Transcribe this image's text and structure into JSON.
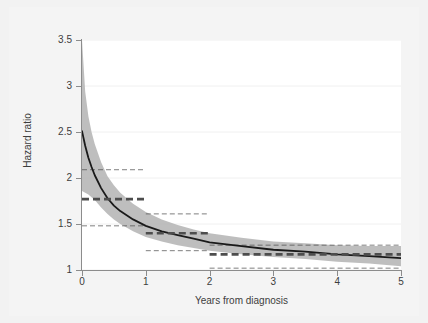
{
  "chart_data": {
    "type": "line",
    "title": "",
    "subtitle": "",
    "xlabel": "Years from diagnosis",
    "ylabel": "Hazard ratio",
    "xlim": [
      0,
      5
    ],
    "ylim": [
      1,
      3.5
    ],
    "xticks": [
      0,
      1,
      2,
      3,
      4,
      5
    ],
    "xtick_labels": [
      "0",
      "1",
      "2",
      "3",
      "4",
      "5"
    ],
    "yticks": [
      1,
      1.5,
      2,
      2.5,
      3,
      3.5
    ],
    "ytick_labels": [
      "1",
      "1.5",
      "2",
      "2.5",
      "3",
      "3.5"
    ],
    "grid": "horizontal-faint",
    "legend": "none",
    "series": [
      {
        "name": "Flexible parametric hazard ratio",
        "style": "solid-line",
        "color": "#1a1a1a",
        "x": [
          0.0,
          0.05,
          0.1,
          0.15,
          0.2,
          0.3,
          0.4,
          0.5,
          0.6,
          0.8,
          1.0,
          1.25,
          1.5,
          1.75,
          2.0,
          2.5,
          3.0,
          3.5,
          4.0,
          4.5,
          5.0
        ],
        "y": [
          2.51,
          2.35,
          2.22,
          2.12,
          2.03,
          1.89,
          1.78,
          1.7,
          1.64,
          1.55,
          1.48,
          1.42,
          1.38,
          1.34,
          1.3,
          1.26,
          1.22,
          1.2,
          1.17,
          1.15,
          1.13
        ]
      },
      {
        "name": "95% confidence interval (upper)",
        "style": "shaded-band-upper",
        "color": "#b3b3b3",
        "x": [
          0.0,
          0.05,
          0.1,
          0.15,
          0.2,
          0.3,
          0.4,
          0.5,
          0.6,
          0.8,
          1.0,
          1.25,
          1.5,
          1.75,
          2.0,
          2.5,
          3.0,
          3.5,
          4.0,
          4.5,
          5.0
        ],
        "y": [
          3.5,
          2.94,
          2.67,
          2.5,
          2.37,
          2.17,
          2.02,
          1.92,
          1.84,
          1.72,
          1.63,
          1.55,
          1.49,
          1.44,
          1.4,
          1.35,
          1.31,
          1.29,
          1.27,
          1.26,
          1.26
        ]
      },
      {
        "name": "95% confidence interval (lower)",
        "style": "shaded-band-lower",
        "color": "#b3b3b3",
        "x": [
          0.0,
          0.05,
          0.1,
          0.15,
          0.2,
          0.3,
          0.4,
          0.5,
          0.6,
          0.8,
          1.0,
          1.25,
          1.5,
          1.75,
          2.0,
          2.5,
          3.0,
          3.5,
          4.0,
          4.5,
          5.0
        ],
        "y": [
          1.86,
          1.84,
          1.82,
          1.79,
          1.76,
          1.68,
          1.61,
          1.55,
          1.5,
          1.42,
          1.36,
          1.31,
          1.27,
          1.24,
          1.21,
          1.17,
          1.14,
          1.12,
          1.09,
          1.07,
          1.04
        ]
      }
    ],
    "step_estimates": [
      {
        "label": "0-1 years",
        "x_start": 0.0,
        "x_end": 1.0,
        "hr": 1.77,
        "ci_low": 1.48,
        "ci_high": 2.09,
        "hr_style": "bold-dashed",
        "ci_style": "thin-dashed",
        "color": "#4d4d4d"
      },
      {
        "label": "1-2 years",
        "x_start": 1.0,
        "x_end": 2.0,
        "hr": 1.4,
        "ci_low": 1.21,
        "ci_high": 1.61,
        "hr_style": "bold-dashed",
        "ci_style": "thin-dashed",
        "color": "#4d4d4d"
      },
      {
        "label": "2-5 years",
        "x_start": 2.0,
        "x_end": 5.0,
        "hr": 1.17,
        "ci_low": 1.02,
        "ci_high": 1.27,
        "hr_style": "bold-dashed",
        "ci_style": "thin-dashed",
        "color": "#4d4d4d"
      }
    ],
    "colors": {
      "figure_background": "#f2f2f2",
      "plot_background": "#ffffff",
      "curve": "#1a1a1a",
      "band": "#b3b3b3",
      "dashed": "#4d4d4d",
      "axis": "#8c8c8c",
      "gridline": "#f0f0f0",
      "text": "#3d3d3d"
    }
  }
}
